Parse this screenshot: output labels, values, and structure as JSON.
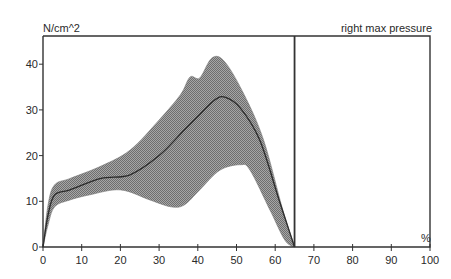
{
  "chart_data": {
    "type": "area",
    "title": "right max pressure",
    "xlabel": "%",
    "ylabel": "N/cm^2",
    "xlim": [
      0,
      100
    ],
    "ylim": [
      0,
      45
    ],
    "grid": false,
    "legend": "none",
    "x_ticks": [
      0,
      10,
      20,
      30,
      40,
      50,
      60,
      70,
      80,
      90,
      100
    ],
    "y_ticks": [
      0,
      10,
      20,
      30,
      40
    ],
    "stance_end_divider_x": 65,
    "series": [
      {
        "name": "upper band",
        "points": [
          [
            0,
            0
          ],
          [
            1.3,
            9.2
          ],
          [
            3,
            13.6
          ],
          [
            7,
            15
          ],
          [
            15,
            17.7
          ],
          [
            22.5,
            21.2
          ],
          [
            30,
            27.8
          ],
          [
            35.5,
            33.3
          ],
          [
            38,
            37.2
          ],
          [
            40.5,
            37
          ],
          [
            43.7,
            41.4
          ],
          [
            47,
            40.5
          ],
          [
            52,
            33.3
          ],
          [
            57,
            23.4
          ],
          [
            62,
            8
          ],
          [
            65,
            0
          ]
        ]
      },
      {
        "name": "lower band",
        "points": [
          [
            0,
            0
          ],
          [
            1.3,
            4.8
          ],
          [
            3,
            8.8
          ],
          [
            7,
            10.3
          ],
          [
            12,
            11.4
          ],
          [
            20,
            12.5
          ],
          [
            27.6,
            10.3
          ],
          [
            33,
            8.8
          ],
          [
            36.5,
            9.2
          ],
          [
            40.5,
            12.5
          ],
          [
            45.7,
            16.8
          ],
          [
            51,
            18
          ],
          [
            53.5,
            16.8
          ],
          [
            58.7,
            8
          ],
          [
            62.5,
            1.5
          ],
          [
            65,
            0
          ]
        ]
      },
      {
        "name": "mean",
        "points": [
          [
            0,
            0
          ],
          [
            1.3,
            7
          ],
          [
            3,
            11.4
          ],
          [
            7,
            12.5
          ],
          [
            15,
            15
          ],
          [
            22.5,
            15.8
          ],
          [
            30,
            20
          ],
          [
            36.5,
            25.6
          ],
          [
            40.5,
            29
          ],
          [
            44.4,
            32.2
          ],
          [
            47,
            32.8
          ],
          [
            51,
            30.4
          ],
          [
            56,
            23.4
          ],
          [
            61,
            10.3
          ],
          [
            65,
            0
          ]
        ]
      }
    ],
    "colors": {
      "band": "#8c8c8c",
      "mean": "#2b2b2b",
      "axis": "#333333"
    }
  },
  "labels": {
    "ylabel": "N/cm^2",
    "title": "right max pressure",
    "unit": "%"
  }
}
